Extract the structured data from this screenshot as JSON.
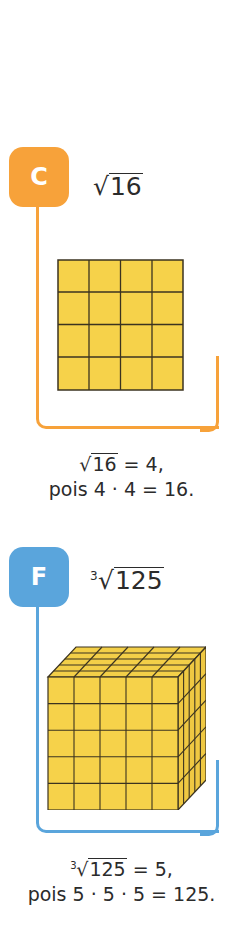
{
  "items": [
    {
      "letter": "C",
      "color": "#f7a23a",
      "expression": {
        "index": "",
        "radicand": "16"
      },
      "figure": {
        "type": "square-grid",
        "rows": 4,
        "cols": 4,
        "fill": "#f6d24a",
        "line": "#3b3320"
      },
      "caption": {
        "line1_radicand": "16",
        "line1_rest": " = 4,",
        "line2": "pois 4 · 4 = 16."
      }
    },
    {
      "letter": "F",
      "color": "#5aa5dc",
      "expression": {
        "index": "3",
        "radicand": "125"
      },
      "figure": {
        "type": "cube-grid",
        "n": 5,
        "fill": "#f6d24a",
        "line": "#3b3320"
      },
      "caption": {
        "line1_index": "3",
        "line1_radicand": "125",
        "line1_rest": " = 5,",
        "line2": "pois 5 · 5 · 5 = 125."
      }
    }
  ]
}
